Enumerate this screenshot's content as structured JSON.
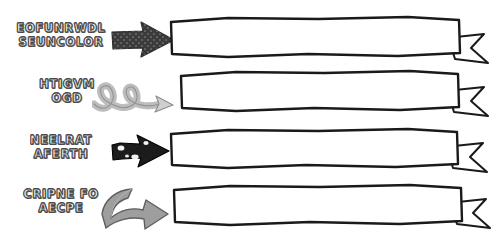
{
  "page": {
    "background_color": "#ffffff"
  },
  "palette": {
    "label_fill": "#f2f2f2",
    "label_outline": "#4a4a4a",
    "arrow_dark": "#3b3b3b",
    "arrow_black": "#1c1c1c",
    "arrow_light": "#cfcfcf",
    "arrow_medium": "#9e9e9e",
    "banner_stroke": "#1a1a1a",
    "banner_fill": "#ffffff"
  },
  "rows": [
    {
      "label": {
        "line1": "EOFUNRWDL",
        "line2": "SEUNCOLOR"
      },
      "arrow": {
        "icon": "block-arrow-right-dotted-icon",
        "style": "dark-dotted-block-arrow",
        "color": "#3b3b3b",
        "direction": "right"
      },
      "banner": {
        "icon": "ribbon-banner-icon",
        "text": "",
        "tail": "forked-right-tail"
      }
    },
    {
      "label": {
        "line1": "HTIGVM",
        "line2": "OGD"
      },
      "arrow": {
        "icon": "curly-loop-arrow-right-icon",
        "style": "light-curly-looping-arrow",
        "color": "#cfcfcf",
        "direction": "right"
      },
      "banner": {
        "icon": "ribbon-banner-icon",
        "text": "",
        "tail": "forked-right-tail"
      }
    },
    {
      "label": {
        "line1": "NEELRAT",
        "line2": "AFERTH"
      },
      "arrow": {
        "icon": "rough-arrow-right-icon",
        "style": "black-torn-edge-arrow",
        "color": "#1c1c1c",
        "direction": "right"
      },
      "banner": {
        "icon": "ribbon-banner-icon",
        "text": "",
        "tail": "forked-right-tail"
      }
    },
    {
      "label": {
        "line1": "CRIPNE FO",
        "line2": "AECPE"
      },
      "arrow": {
        "icon": "curved-swoosh-arrow-right-icon",
        "style": "gray-curved-swoosh-arrow",
        "color": "#9e9e9e",
        "direction": "right"
      },
      "banner": {
        "icon": "ribbon-banner-icon",
        "text": "",
        "tail": "forked-right-tail"
      }
    }
  ]
}
